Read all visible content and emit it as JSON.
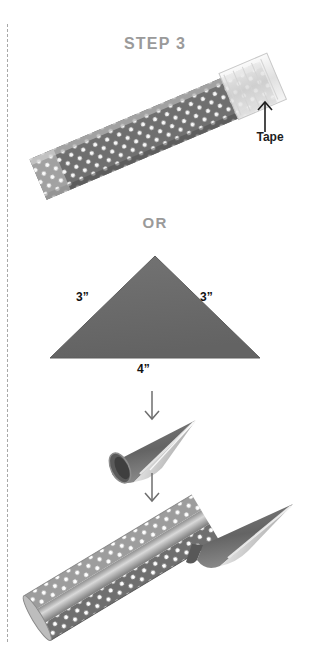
{
  "page": {
    "width": 310,
    "height": 666,
    "background": "#ffffff"
  },
  "title": {
    "text": "STEP 3",
    "color": "#9a9a9a"
  },
  "alternative_label": {
    "text": "OR",
    "color": "#9a9a9a"
  },
  "tape_callout": {
    "label": "Tape",
    "color": "#1d1d1d",
    "arrow_direction": "up"
  },
  "triangle": {
    "left_side_label": "3”",
    "right_side_label": "3”",
    "base_label": "4”",
    "fill_color": "#6b6b6b",
    "label_color": "#111111"
  },
  "flow_arrows": [
    {
      "name": "fold-arrow",
      "direction": "down"
    },
    {
      "name": "attach-arrow",
      "direction": "down"
    }
  ],
  "colors": {
    "paper_gray": "#6b6b6b",
    "paper_gray_light": "#a5a5a5",
    "paper_gray_dark": "#4a4a4a",
    "dot_white": "#ffffff",
    "metallic_light": "#e8e8e8",
    "metallic_mid": "#b9b9b9",
    "cut_line": "#a8a8a8",
    "muted_text": "#9a9a9a",
    "dark_text": "#1d1d1d"
  },
  "illustrations": [
    {
      "name": "polka-dot-strip",
      "description": "Rolled polka dot paper strip running diagonally with translucent tape at upper right end"
    },
    {
      "name": "gray-triangle",
      "description": "Isosceles paper triangle, 3 inch sides and 4 inch base"
    },
    {
      "name": "rolled-cone",
      "description": "Triangle rolled into a pointed cone with open mouth"
    },
    {
      "name": "final-assembly",
      "description": "Polka dot tube with cone tip attached forming a pointed rocket shape"
    }
  ]
}
